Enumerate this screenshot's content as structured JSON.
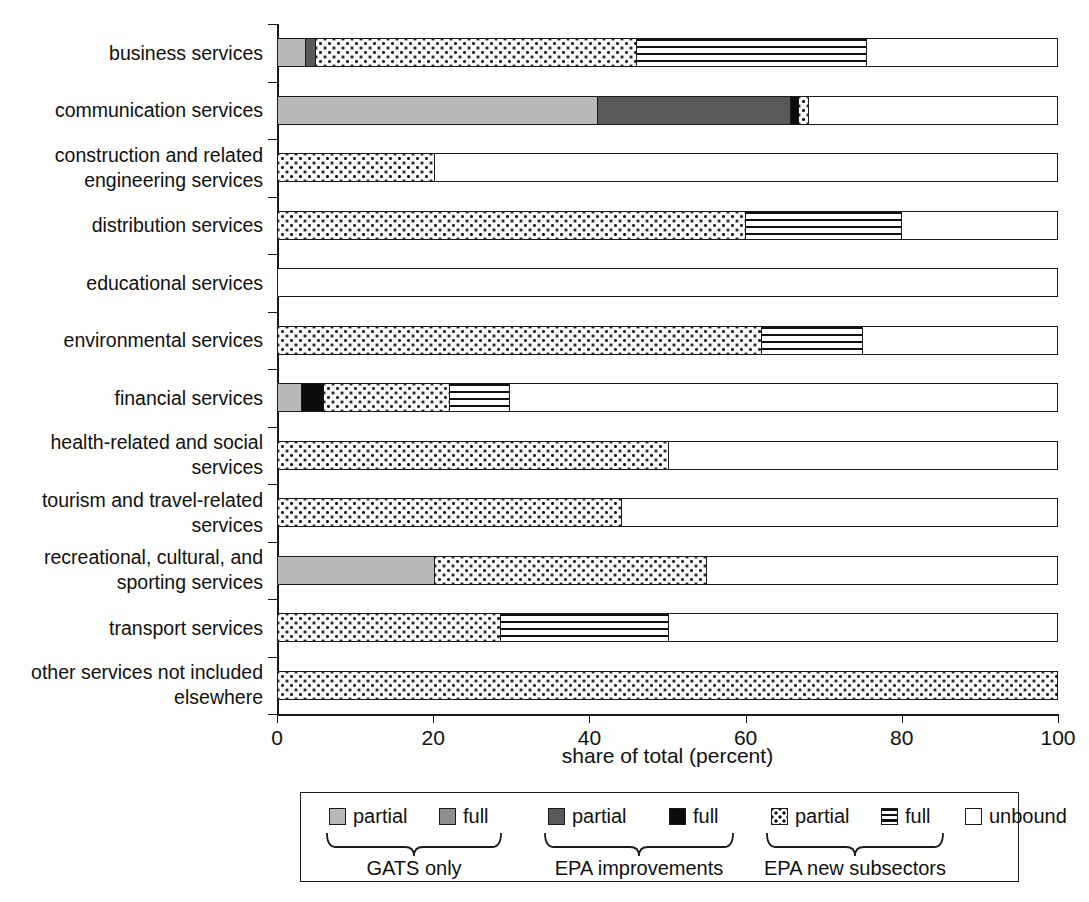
{
  "chart_data": {
    "type": "bar",
    "orientation": "horizontal",
    "stacked": true,
    "title": "",
    "xlabel": "share of total (percent)",
    "ylabel": "",
    "xlim": [
      0,
      100
    ],
    "xticks": [
      0,
      20,
      40,
      60,
      80,
      100
    ],
    "grid": false,
    "legend_position": "bottom",
    "categories": [
      "business services",
      "communication services",
      "construction and related engineering services",
      "distribution services",
      "educational services",
      "environmental services",
      "financial services",
      "health-related and social services",
      "tourism and travel-related services",
      "recreational, cultural, and sporting services",
      "transport services",
      "other services not included elsewhere"
    ],
    "category_label_lines": [
      [
        "business services"
      ],
      [
        "communication services"
      ],
      [
        "construction and related",
        "engineering services"
      ],
      [
        "distribution services"
      ],
      [
        "educational services"
      ],
      [
        "environmental services"
      ],
      [
        "financial services"
      ],
      [
        "health-related and social",
        "services"
      ],
      [
        "tourism and travel-related",
        "services"
      ],
      [
        "recreational, cultural, and",
        "sporting services"
      ],
      [
        "transport services"
      ],
      [
        "other services not included",
        "elsewhere"
      ]
    ],
    "series": [
      {
        "name": "GATS only partial",
        "key": "gats_partial",
        "fill": "f-gats-partial",
        "values": [
          3.5,
          41.0,
          0,
          0,
          0,
          0,
          3.0,
          0,
          0,
          20.0,
          0,
          0
        ]
      },
      {
        "name": "GATS only full",
        "key": "gats_full",
        "fill": "f-gats-full",
        "values": [
          0,
          0,
          0,
          0,
          0,
          0,
          0,
          0,
          0,
          0,
          0,
          0
        ]
      },
      {
        "name": "EPA improvements partial",
        "key": "epa_partial",
        "fill": "f-epa-partial",
        "values": [
          1.2,
          24.7,
          0,
          0,
          0,
          0,
          0,
          0,
          0,
          0,
          0,
          0
        ]
      },
      {
        "name": "EPA improvements full",
        "key": "epa_full",
        "fill": "f-epa-full",
        "values": [
          0,
          1.0,
          0,
          0,
          0,
          0,
          2.8,
          0,
          0,
          0,
          0,
          0
        ]
      },
      {
        "name": "EPA new subsectors partial",
        "key": "new_partial",
        "fill": "f-new-partial",
        "values": [
          41.3,
          1.3,
          20.0,
          60.0,
          0,
          62.0,
          16.2,
          50.0,
          44.0,
          35.0,
          28.5,
          100.0
        ]
      },
      {
        "name": "EPA new subsectors full",
        "key": "new_full",
        "fill": "f-new-full",
        "values": [
          29.5,
          0,
          0,
          20.0,
          0,
          13.0,
          7.7,
          0,
          0,
          0,
          21.5,
          0
        ]
      },
      {
        "name": "unbound",
        "key": "unbound",
        "fill": "f-unbound",
        "values": [
          24.5,
          32.0,
          80.0,
          20.0,
          100.0,
          25.0,
          70.3,
          50.0,
          56.0,
          45.0,
          50.0,
          0
        ]
      }
    ]
  },
  "legend": {
    "items": [
      {
        "label": "partial",
        "fill": "f-gats-partial",
        "icon": "legend-swatch-gats-partial"
      },
      {
        "label": "full",
        "fill": "f-gats-full",
        "icon": "legend-swatch-gats-full"
      },
      {
        "label": "partial",
        "fill": "f-epa-partial",
        "icon": "legend-swatch-epa-partial"
      },
      {
        "label": "full",
        "fill": "f-epa-full",
        "icon": "legend-swatch-epa-full"
      },
      {
        "label": "partial",
        "fill": "sw-new-partial",
        "icon": "legend-swatch-new-partial"
      },
      {
        "label": "full",
        "fill": "sw-new-full",
        "icon": "legend-swatch-new-full"
      },
      {
        "label": "unbound",
        "fill": "f-unbound",
        "icon": "legend-swatch-unbound"
      }
    ],
    "groups": [
      {
        "label": "GATS only"
      },
      {
        "label": "EPA improvements"
      },
      {
        "label": "EPA new subsectors"
      }
    ]
  },
  "colors": {
    "gats_partial": "#b9b9b9",
    "gats_full": "#8e8e8e",
    "epa_partial": "#595959",
    "epa_full": "#0c0c0c",
    "outline": "#1a1a1a",
    "unbound": "#ffffff"
  }
}
